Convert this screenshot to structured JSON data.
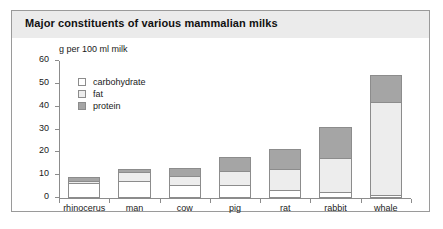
{
  "figure": {
    "title": "Major constituents of various mammalian milks"
  },
  "chart_data": {
    "type": "bar",
    "subtype": "stacked",
    "title": "Major constituents of various mammalian milks",
    "xlabel": "",
    "ylabel": "g per 100 ml milk",
    "ylim": [
      0,
      60
    ],
    "ytick_values": [
      0,
      10,
      20,
      30,
      40,
      50,
      60
    ],
    "ytick_labels": [
      "0",
      "10",
      "20",
      "30",
      "40",
      "50",
      "60"
    ],
    "grid": false,
    "legend_position": "upper-left-inside",
    "categories": [
      "rhinocerus",
      "man",
      "cow",
      "pig",
      "rat",
      "rabbit",
      "whale"
    ],
    "series": [
      {
        "name": "carbohydrate",
        "color": "#ffffff",
        "values": [
          6.5,
          7.5,
          5.5,
          5.5,
          3.5,
          2.5,
          1.5
        ]
      },
      {
        "name": "fat",
        "color": "#ededed",
        "values": [
          1.0,
          4.0,
          4.0,
          6.5,
          9.0,
          15.0,
          40.5
        ]
      },
      {
        "name": "protein",
        "color": "#a5a5a5",
        "values": [
          1.5,
          1.0,
          3.5,
          6.0,
          9.0,
          13.5,
          12.0
        ]
      }
    ],
    "totals": [
      9.0,
      12.5,
      13.0,
      18.0,
      21.5,
      31.0,
      54.0
    ]
  },
  "legend": {
    "items": [
      {
        "label": "carbohydrate"
      },
      {
        "label": "fat"
      },
      {
        "label": "protein"
      }
    ]
  }
}
